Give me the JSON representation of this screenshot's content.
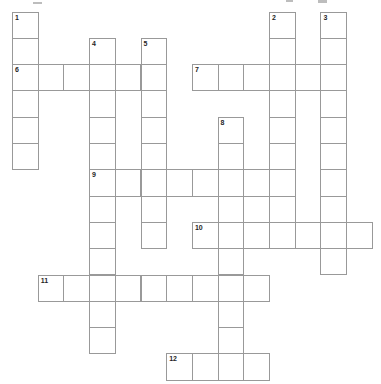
{
  "app": {
    "name": "crossword-puzzle",
    "description": "Empty numbered crossword grid"
  },
  "grid": {
    "logical_cols": 14,
    "logical_rows": 14,
    "total_cells": 80,
    "clue_numbers": [
      "1",
      "2",
      "3",
      "4",
      "5",
      "6",
      "7",
      "8",
      "9",
      "10",
      "11",
      "12"
    ],
    "entries": [
      {
        "number": "1",
        "direction": "down",
        "row": 0,
        "col": 0,
        "length": 6
      },
      {
        "number": "2",
        "direction": "down",
        "row": 0,
        "col": 10,
        "length": 9
      },
      {
        "number": "3",
        "direction": "down",
        "row": 0,
        "col": 12,
        "length": 10
      },
      {
        "number": "4",
        "direction": "down",
        "row": 1,
        "col": 3,
        "length": 12
      },
      {
        "number": "5",
        "direction": "down",
        "row": 1,
        "col": 5,
        "length": 8
      },
      {
        "number": "6",
        "direction": "across",
        "row": 2,
        "col": 0,
        "length": 6
      },
      {
        "number": "7",
        "direction": "across",
        "row": 2,
        "col": 7,
        "length": 6
      },
      {
        "number": "8",
        "direction": "down",
        "row": 4,
        "col": 8,
        "length": 10
      },
      {
        "number": "9",
        "direction": "across",
        "row": 6,
        "col": 3,
        "length": 8
      },
      {
        "number": "10",
        "direction": "across",
        "row": 8,
        "col": 7,
        "length": 7
      },
      {
        "number": "11",
        "direction": "across",
        "row": 10,
        "col": 1,
        "length": 9
      },
      {
        "number": "12",
        "direction": "across",
        "row": 13,
        "col": 6,
        "length": 4
      }
    ],
    "cell_values": {}
  },
  "colors": {
    "background": "#ffffff",
    "grid_line": "#999999",
    "number_text": "#1f1f1f",
    "cell_fill": "#ffffff",
    "artifact_gray": "#9a9a9a"
  },
  "artifacts": {
    "description": "faint cut-off gray marks along top edge of screenshot",
    "marks": [
      {
        "x": 33,
        "y": 2,
        "w": 9,
        "h": 2
      },
      {
        "x": 286,
        "y": 0,
        "w": 7,
        "h": 2
      },
      {
        "x": 318,
        "y": 0,
        "w": 9,
        "h": 3
      }
    ]
  }
}
